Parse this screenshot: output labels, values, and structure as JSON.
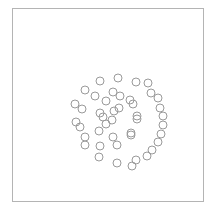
{
  "figure": {
    "name": "spiral-scatter-figure",
    "background_color": "#ffffff",
    "width": 216,
    "height": 214
  },
  "frame": {
    "name": "plot-frame",
    "border_color": "#b4b4b4",
    "border_width": 1,
    "left": 12,
    "top": 8,
    "width": 192,
    "height": 194
  },
  "marker_style": {
    "shape": "open-circle",
    "radius": 4,
    "stroke_color": "#9a9a9a",
    "stroke_width": 1,
    "fill": "none"
  },
  "chart_data": {
    "type": "scatter",
    "title": "",
    "subtitle": "",
    "xlabel": "",
    "ylabel": "",
    "xlim": [
      12,
      204
    ],
    "ylim": [
      8,
      202
    ],
    "grid": false,
    "legend": false,
    "legend_position": "none",
    "axis_ticks": false,
    "axis_tick_labels": [],
    "annotations": [],
    "point_count": 44,
    "series": [
      {
        "name": "arm-a",
        "marker": "open-circle",
        "color": "#9a9a9a",
        "points": [
          [
            114,
            111
          ],
          [
            119,
            108
          ],
          [
            112,
            120
          ],
          [
            103,
            117
          ],
          [
            99,
            131
          ],
          [
            113,
            137
          ],
          [
            131,
            133
          ],
          [
            137,
            116
          ],
          [
            130,
            100
          ],
          [
            113,
            92
          ],
          [
            95,
            96
          ],
          [
            82,
            109
          ],
          [
            80,
            127
          ],
          [
            85,
            145
          ],
          [
            99,
            157
          ],
          [
            117,
            163
          ],
          [
            136,
            160
          ],
          [
            152,
            150
          ],
          [
            161,
            134
          ],
          [
            163,
            116
          ],
          [
            158,
            98
          ],
          [
            148,
            83
          ]
        ]
      },
      {
        "name": "arm-b",
        "marker": "open-circle",
        "color": "#9a9a9a",
        "points": [
          [
            106,
            124
          ],
          [
            100,
            113
          ],
          [
            106,
            101
          ],
          [
            120,
            96
          ],
          [
            133,
            104
          ],
          [
            137,
            119
          ],
          [
            131,
            135
          ],
          [
            117,
            145
          ],
          [
            100,
            146
          ],
          [
            85,
            137
          ],
          [
            76,
            122
          ],
          [
            75,
            104
          ],
          [
            85,
            90
          ],
          [
            100,
            81
          ],
          [
            118,
            78
          ],
          [
            136,
            82
          ],
          [
            151,
            93
          ],
          [
            160,
            108
          ],
          [
            163,
            125
          ],
          [
            158,
            142
          ],
          [
            147,
            156
          ],
          [
            132,
            166
          ]
        ]
      }
    ]
  }
}
